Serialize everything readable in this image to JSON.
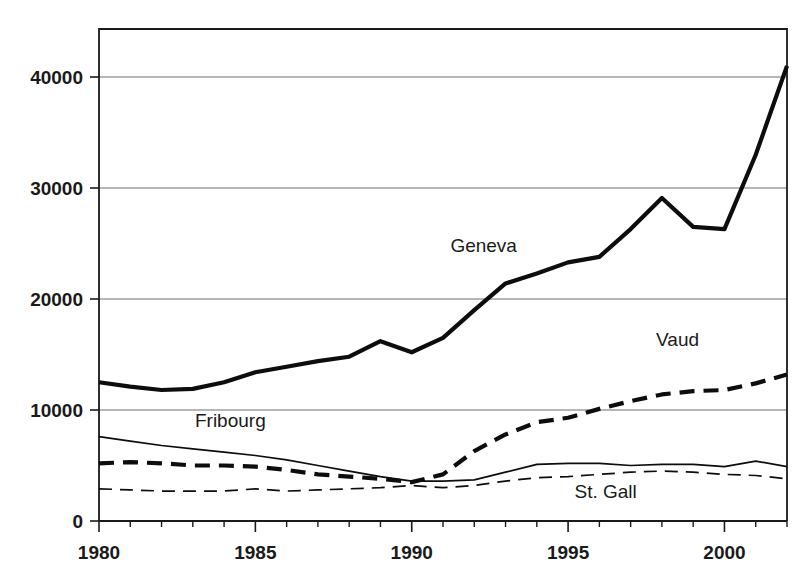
{
  "chart_data": {
    "type": "line",
    "title": "",
    "subtitle": "",
    "xlabel": "",
    "ylabel": "",
    "xlim": [
      1980,
      2002
    ],
    "ylim": [
      0,
      45000
    ],
    "grid": "horizontal",
    "legend_position": "inline-annotations",
    "x": [
      1980,
      1981,
      1982,
      1983,
      1984,
      1985,
      1986,
      1987,
      1988,
      1989,
      1990,
      1991,
      1992,
      1993,
      1994,
      1995,
      1996,
      1997,
      1998,
      1999,
      2000,
      2001,
      2002
    ],
    "y_ticks": [
      0,
      10000,
      20000,
      30000,
      40000
    ],
    "y_tick_labels": [
      "0",
      "10000",
      "20000",
      "30000",
      "40000"
    ],
    "x_ticks": [
      1980,
      1981,
      1982,
      1983,
      1984,
      1985,
      1986,
      1987,
      1988,
      1989,
      1990,
      1991,
      1992,
      1993,
      1994,
      1995,
      1996,
      1997,
      1998,
      1999,
      2000,
      2001,
      2002
    ],
    "x_tick_labels_shown": [
      "1980",
      "1985",
      "1990",
      "1995",
      "2000"
    ],
    "x_labeled_ticks": [
      1980,
      1985,
      1990,
      1995,
      2000
    ],
    "series": [
      {
        "name": "Geneva",
        "style": "solid-thick",
        "values": [
          12500,
          12100,
          11800,
          11900,
          12500,
          13400,
          13900,
          14400,
          14800,
          16200,
          15200,
          16500,
          19000,
          21400,
          22300,
          23300,
          23800,
          26300,
          29100,
          26500,
          26300,
          33000,
          41000
        ],
        "annotation": {
          "text": "Geneva",
          "x": 1992.3,
          "y": 24200
        }
      },
      {
        "name": "Vaud",
        "style": "dashed-thick",
        "values": [
          5200,
          5300,
          5200,
          5000,
          5000,
          4900,
          4600,
          4200,
          4000,
          3800,
          3500,
          4200,
          6300,
          7800,
          8900,
          9300,
          10100,
          10800,
          11400,
          11700,
          11800,
          12400,
          13200
        ],
        "annotation": {
          "text": "Vaud",
          "x": 1998.5,
          "y": 15800
        }
      },
      {
        "name": "Fribourg",
        "style": "solid-thin",
        "values": [
          7600,
          7200,
          6800,
          6500,
          6200,
          5900,
          5500,
          5000,
          4500,
          4000,
          3600,
          3600,
          3700,
          4400,
          5100,
          5200,
          5200,
          5000,
          5100,
          5100,
          4900,
          5400,
          4900
        ],
        "annotation": {
          "text": "Fribourg",
          "x": 1984.2,
          "y": 8500
        }
      },
      {
        "name": "St. Gall",
        "style": "dashed-thin",
        "values": [
          2900,
          2800,
          2700,
          2700,
          2700,
          2900,
          2700,
          2800,
          2900,
          3000,
          3200,
          3000,
          3200,
          3600,
          3900,
          4000,
          4200,
          4400,
          4500,
          4400,
          4200,
          4100,
          3800
        ],
        "annotation": {
          "text": "St. Gall",
          "x": 1996.2,
          "y": 2100
        }
      }
    ]
  },
  "axes": {
    "y_labels": [
      "40000",
      "30000",
      "20000",
      "10000",
      "0"
    ],
    "x_labels": [
      "1980",
      "1985",
      "1990",
      "1995",
      "2000"
    ]
  },
  "colors": {
    "line": "#0d0d0d",
    "grid": "#6e6e6e",
    "axis": "#1a1a1a",
    "background": "#ffffff"
  }
}
